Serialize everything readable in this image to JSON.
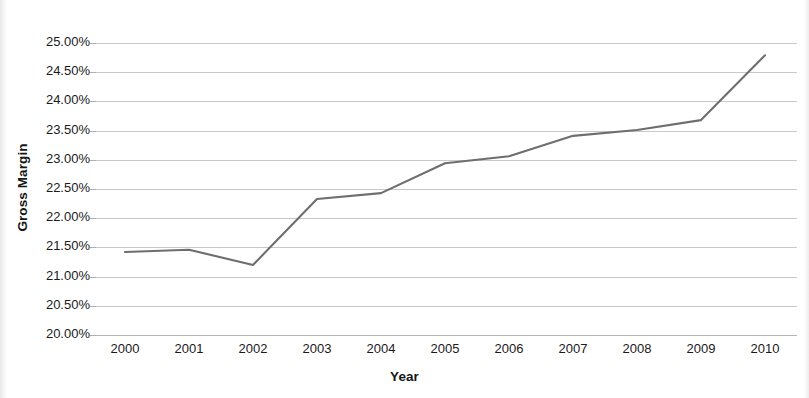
{
  "chart_data": {
    "type": "line",
    "title": "",
    "xlabel": "Year",
    "ylabel": "Gross Margin",
    "categories": [
      "2000",
      "2001",
      "2002",
      "2003",
      "2004",
      "2005",
      "2006",
      "2007",
      "2008",
      "2009",
      "2010"
    ],
    "x": [
      2000,
      2001,
      2002,
      2003,
      2004,
      2005,
      2006,
      2007,
      2008,
      2009,
      2010
    ],
    "values": [
      21.42,
      21.46,
      21.2,
      22.33,
      22.43,
      22.94,
      23.06,
      23.41,
      23.51,
      23.68,
      24.79
    ],
    "series": [
      {
        "name": "Gross Margin",
        "values": [
          21.42,
          21.46,
          21.2,
          22.33,
          22.43,
          22.94,
          23.06,
          23.41,
          23.51,
          23.68,
          24.79
        ]
      }
    ],
    "y_tick_labels": [
      "25.00%",
      "24.50%",
      "24.00%",
      "23.50%",
      "23.00%",
      "22.50%",
      "22.00%",
      "21.50%",
      "21.00%",
      "20.50%",
      "20.00%"
    ],
    "y_ticks": [
      25.0,
      24.5,
      24.0,
      23.5,
      23.0,
      22.5,
      22.0,
      21.5,
      21.0,
      20.5,
      20.0
    ],
    "ylim": [
      20.0,
      25.0
    ],
    "xlim": [
      2000,
      2010
    ],
    "y_unit": "%",
    "grid": true,
    "legend": false,
    "legend_position": "none",
    "line_color": "#6e6e6e",
    "gridline_color": "#c9c9c9",
    "background_color": "#ffffff",
    "text_color": "#1a1a1a"
  }
}
